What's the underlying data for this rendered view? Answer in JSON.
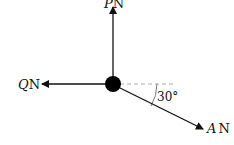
{
  "diagram": {
    "type": "force-diagram",
    "particle": {
      "x": 113,
      "y": 84,
      "radius": 8,
      "color": "#000000"
    },
    "forces": [
      {
        "name": "P",
        "symbol": "P",
        "unit": "N",
        "direction": "up",
        "tip": [
          113,
          6
        ]
      },
      {
        "name": "Q",
        "symbol": "Q",
        "unit": "N",
        "direction": "left",
        "tip": [
          41,
          84
        ]
      },
      {
        "name": "A",
        "symbol": "A",
        "unit": "N",
        "direction": "30° below horizontal to the right",
        "tip": [
          204,
          129
        ]
      }
    ],
    "reference_line": {
      "style": "dashed",
      "color": "#aaaaaa"
    },
    "angle": {
      "value": "30°",
      "between": [
        "reference_line",
        "A"
      ]
    },
    "labels": {
      "p_symbol": "P",
      "p_unit": "N",
      "q_symbol": "Q",
      "q_unit": "N",
      "a_symbol": "A",
      "a_unit": "N",
      "angle_text": "30°"
    }
  }
}
